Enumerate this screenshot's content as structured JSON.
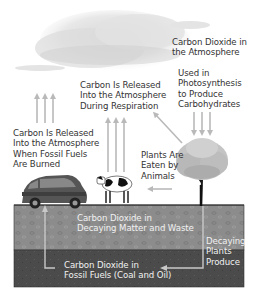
{
  "diagram": {
    "labels": {
      "co2_atmosphere": [
        "Carbon Dioxide in",
        "the Atmosphere"
      ],
      "photosynthesis": [
        "Used in",
        "Photosynthesis",
        "to Produce",
        "Carbohydrates"
      ],
      "respiration": [
        "Carbon Is Released",
        "Into the Atmosphere",
        "During Respiration"
      ],
      "fossil_fuels_burned": [
        "Carbon Is Released",
        "Into the Atmosphere",
        "When Fossil Fuels",
        "Are Burned"
      ],
      "plants_eaten": [
        "Plants Are",
        "Eaten by",
        "Animals"
      ],
      "decaying_matter": [
        "Carbon Dioxide in",
        "Decaying Matter and Waste"
      ],
      "decaying_plants": [
        "Decaying",
        "Plants",
        "Produce"
      ],
      "fossil_fuels": [
        "Carbon Dioxide in",
        "Fossil Fuels (Coal and Oil)"
      ]
    },
    "elements": [
      "cloud",
      "car",
      "cow",
      "tree",
      "soil-layer",
      "fossil-fuel-layer"
    ],
    "colors": {
      "arrow": "#b9b9b9",
      "soil": "#8a8a8a",
      "fossil_layer": "#4a4a4a",
      "text": "#333333",
      "text_on_ground": "#f1f1f1"
    }
  }
}
